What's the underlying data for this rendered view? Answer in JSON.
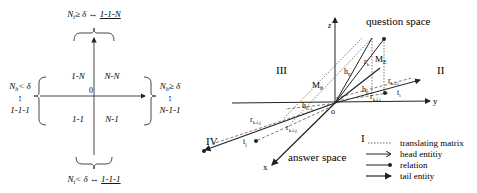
{
  "left_panel": {
    "top_condition": {
      "pre": "N",
      "sub": "t",
      "rel": "≥ δ ↔ ",
      "mapping": "1-1-N"
    },
    "bottom_condition": {
      "pre": "N",
      "sub": "t",
      "rel": "< δ ↔ ",
      "mapping": "1-1-1"
    },
    "left_condition": {
      "pre": "N",
      "sub": "h",
      "rel": "< δ",
      "arrow": "↕",
      "mapping": "1-1-1"
    },
    "right_condition": {
      "pre": "N",
      "sub": "h",
      "rel": "≥ δ",
      "arrow": "↕",
      "mapping": "N-1-1"
    },
    "origin": "0",
    "quadrants": {
      "top_left": "1-N",
      "top_right": "N-N",
      "bottom_left": "1-1",
      "bottom_right": "N-1"
    }
  },
  "right_panel": {
    "spaces": {
      "question": "question space",
      "answer": "answer space"
    },
    "axes": {
      "x": "x",
      "y": "y",
      "z": "z",
      "origin": "o"
    },
    "regions": {
      "II": "II",
      "III": "III",
      "IV": "IV",
      "I": "I"
    },
    "labels": {
      "M_theta": "M",
      "M_theta_sub": "θ",
      "M_E": "M",
      "M_E_sub": "E",
      "h_E": "h",
      "h_E_sub": "E",
      "r_k": "r",
      "r_k_sub": "k",
      "h_E_perp": "h",
      "h_E_perp_sub": "E⊥",
      "r_k_perp_i": "r",
      "r_k_perp_i_sub": "k⊥i",
      "r_k_perp_i2": "r",
      "r_k_perp_i2_sub": "k⊥i",
      "t_i": "t",
      "t_i_sub": "i",
      "r_k_perp_j": "r",
      "r_k_perp_j_sub": "k⊥j",
      "r_k_perp_j2": "r",
      "r_k_perp_j2_sub": "k⊥j",
      "t_j": "t",
      "t_j_sub": "j",
      "h_perp": "h",
      "h_perp_sub": "E⊥"
    },
    "legend": [
      {
        "style": "dotted",
        "label": "translating matrix"
      },
      {
        "style": "arrow-open",
        "label": "head entitiy"
      },
      {
        "style": "dot-end",
        "label": "relation"
      },
      {
        "style": "arrow-solid",
        "label": "tail entity"
      }
    ]
  }
}
